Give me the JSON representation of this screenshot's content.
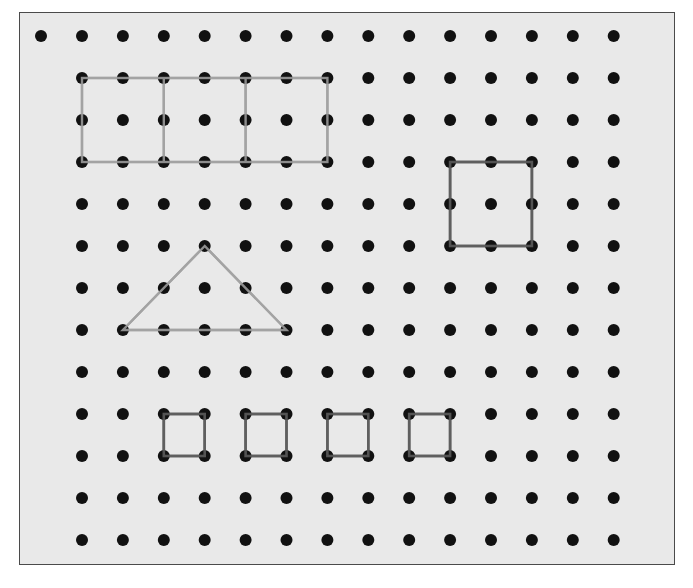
{
  "figure": {
    "type": "dot-grid geoboard",
    "grid": {
      "columns_x": [
        82,
        122.9,
        163.8,
        204.7,
        245.6,
        286.5,
        327.4,
        368.3,
        409.2,
        450.1,
        491,
        531.9,
        572.8,
        613.7
      ],
      "rows_y": [
        36,
        78,
        120,
        162,
        204,
        246,
        288,
        330,
        372,
        414,
        456,
        498,
        540
      ],
      "extra_dot_row0_x": 41,
      "dot_radius": 6,
      "dot_color": "#111111"
    },
    "shapes": [
      {
        "name": "rectangle-divided-into-three",
        "kind": "rectangle",
        "color": "#a3a3a3",
        "outline_cells": {
          "c1": 0,
          "r1": 1,
          "c2": 6,
          "r2": 3
        },
        "dividers_at_columns": [
          2,
          4
        ]
      },
      {
        "name": "large-square",
        "kind": "square",
        "color": "#5f5f5f",
        "outline_cells": {
          "c1": 9,
          "r1": 3,
          "c2": 11,
          "r2": 5
        }
      },
      {
        "name": "triangle",
        "kind": "triangle",
        "color": "#a3a3a3",
        "vertices_cells": [
          [
            3,
            5
          ],
          [
            1,
            7
          ],
          [
            5,
            7
          ]
        ]
      },
      {
        "name": "small-square-1",
        "kind": "square",
        "color": "#5f5f5f",
        "outline_cells": {
          "c1": 2,
          "r1": 9,
          "c2": 3,
          "r2": 10
        }
      },
      {
        "name": "small-square-2",
        "kind": "square",
        "color": "#5f5f5f",
        "outline_cells": {
          "c1": 4,
          "r1": 9,
          "c2": 5,
          "r2": 10
        }
      },
      {
        "name": "small-square-3",
        "kind": "square",
        "color": "#5f5f5f",
        "outline_cells": {
          "c1": 6,
          "r1": 9,
          "c2": 7,
          "r2": 10
        }
      },
      {
        "name": "small-square-4",
        "kind": "square",
        "color": "#5f5f5f",
        "outline_cells": {
          "c1": 8,
          "r1": 9,
          "c2": 9,
          "r2": 10
        }
      }
    ],
    "colors": {
      "background": "#e9e9e9",
      "border": "#4a4a4a",
      "light_line": "#a3a3a3",
      "dark_line": "#5f5f5f"
    }
  }
}
